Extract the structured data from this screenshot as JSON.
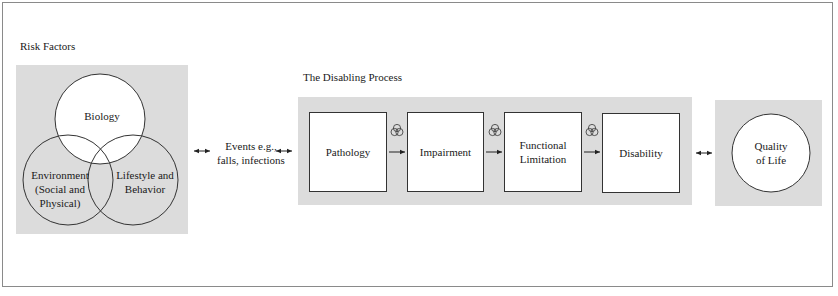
{
  "risk_factors": {
    "heading": "Risk Factors",
    "circles": [
      {
        "id": "biology",
        "label_lines": [
          "Biology"
        ]
      },
      {
        "id": "environment",
        "label_lines": [
          "Environment",
          "(Social and",
          "Physical)"
        ]
      },
      {
        "id": "lifestyle",
        "label_lines": [
          "Lifestyle and",
          "Behavior"
        ]
      }
    ]
  },
  "events": {
    "label_lines": [
      "Events e.g.,",
      "falls, infections"
    ]
  },
  "disabling_process": {
    "heading": "The Disabling Process",
    "stages": [
      {
        "label_lines": [
          "Pathology"
        ]
      },
      {
        "label_lines": [
          "Impairment"
        ]
      },
      {
        "label_lines": [
          "Functional",
          "Limitation"
        ]
      },
      {
        "label_lines": [
          "Disability"
        ]
      }
    ],
    "connector_icon": "three-circle-venn-icon"
  },
  "outcome": {
    "label_lines": [
      "Quality",
      "of Life"
    ]
  },
  "colors": {
    "panel": "#dcdcdc",
    "stroke": "#333333",
    "background": "#ffffff"
  }
}
